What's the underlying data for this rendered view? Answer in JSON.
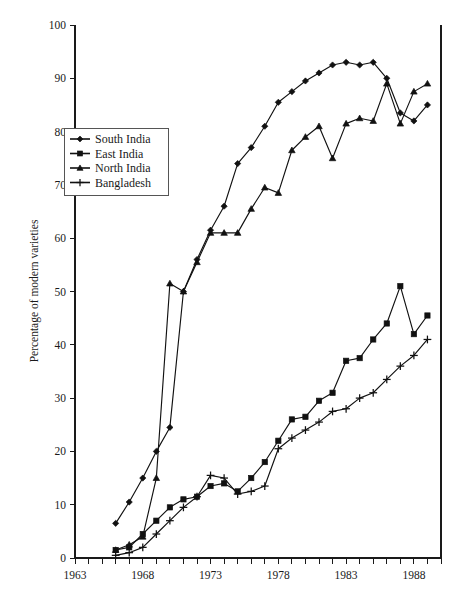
{
  "chart_data": {
    "type": "line",
    "title": "",
    "subtitle": "",
    "xlabel": "",
    "ylabel": "Percentage of modern varieties",
    "xlim": [
      1963,
      1990
    ],
    "ylim": [
      0,
      100
    ],
    "grid": false,
    "legend_position": "upper-left-inside",
    "x_tick_labels": [
      "1963",
      "1968",
      "1973",
      "1978",
      "1983",
      "1988"
    ],
    "x_tick_values": [
      1963,
      1968,
      1973,
      1978,
      1983,
      1988
    ],
    "x_minor_tick_interval": 1,
    "y_tick_labels": [
      "0",
      "10",
      "20",
      "30",
      "40",
      "50",
      "60",
      "70",
      "80",
      "90",
      "100"
    ],
    "y_tick_values": [
      0,
      10,
      20,
      30,
      40,
      50,
      60,
      70,
      80,
      90,
      100
    ],
    "series": [
      {
        "name": "South India",
        "marker": "diamond",
        "x": [
          1966,
          1967,
          1968,
          1969,
          1970,
          1971,
          1972,
          1973,
          1974,
          1975,
          1976,
          1977,
          1978,
          1979,
          1980,
          1981,
          1982,
          1983,
          1984,
          1985,
          1986,
          1987,
          1988,
          1989
        ],
        "values": [
          6.5,
          10.5,
          15.0,
          20.0,
          24.5,
          50.0,
          56.0,
          61.5,
          66.0,
          74.0,
          77.0,
          81.0,
          85.5,
          87.5,
          89.5,
          91.0,
          92.5,
          93.0,
          92.5,
          93.0,
          90.0,
          83.5,
          82.0,
          85.0
        ]
      },
      {
        "name": "East India",
        "marker": "square",
        "x": [
          1966,
          1967,
          1968,
          1969,
          1970,
          1971,
          1972,
          1973,
          1974,
          1975,
          1976,
          1977,
          1978,
          1979,
          1980,
          1981,
          1982,
          1983,
          1984,
          1985,
          1986,
          1987,
          1988,
          1989
        ],
        "values": [
          1.5,
          2.0,
          4.5,
          7.0,
          9.5,
          11.0,
          11.5,
          13.5,
          14.0,
          12.5,
          15.0,
          18.0,
          22.0,
          26.0,
          26.5,
          29.5,
          31.0,
          37.0,
          37.5,
          41.0,
          44.0,
          51.0,
          42.0,
          45.5
        ]
      },
      {
        "name": "North India",
        "marker": "triangle",
        "x": [
          1966,
          1967,
          1968,
          1969,
          1970,
          1971,
          1972,
          1973,
          1974,
          1975,
          1976,
          1977,
          1978,
          1979,
          1980,
          1981,
          1982,
          1983,
          1984,
          1985,
          1986,
          1987,
          1988,
          1989
        ],
        "values": [
          1.5,
          2.5,
          4.0,
          15.0,
          51.5,
          50.0,
          55.5,
          61.0,
          61.0,
          61.0,
          65.5,
          69.5,
          68.5,
          76.5,
          79.0,
          81.0,
          75.0,
          81.5,
          82.5,
          82.0,
          89.0,
          81.5,
          87.5,
          89.0
        ]
      },
      {
        "name": "Bangladesh",
        "marker": "plus",
        "x": [
          1966,
          1967,
          1968,
          1969,
          1970,
          1971,
          1972,
          1973,
          1974,
          1975,
          1976,
          1977,
          1978,
          1979,
          1980,
          1981,
          1982,
          1983,
          1984,
          1985,
          1986,
          1987,
          1988,
          1989
        ],
        "values": [
          0.5,
          1.0,
          2.0,
          4.5,
          7.0,
          9.5,
          11.5,
          15.5,
          15.0,
          12.0,
          12.5,
          13.5,
          20.5,
          22.5,
          24.0,
          25.5,
          27.5,
          28.0,
          30.0,
          31.0,
          33.5,
          36.0,
          38.0,
          41.0
        ]
      }
    ]
  },
  "legend": {
    "entries": [
      {
        "label": "South India",
        "marker": "diamond"
      },
      {
        "label": "East India",
        "marker": "square"
      },
      {
        "label": "North India",
        "marker": "triangle"
      },
      {
        "label": "Bangladesh",
        "marker": "plus"
      }
    ]
  },
  "axes": {
    "y_title": "Percentage of modern varieties"
  },
  "colors": {
    "ink": "#111111",
    "axis": "#1a1a1a",
    "background": "#ffffff",
    "legend_border": "#555555"
  }
}
